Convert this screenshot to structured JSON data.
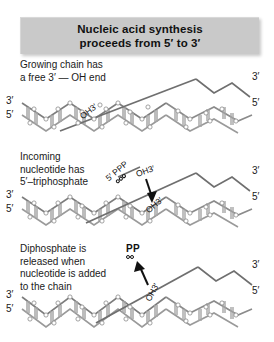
{
  "figure": {
    "width": 274,
    "height": 342,
    "background": "#ffffff"
  },
  "title": {
    "line1": "Nucleic acid synthesis",
    "line2": "proceeds from 5′ to 3′",
    "background_color": "#c9c9c9",
    "text_color": "#111111"
  },
  "panels": [
    {
      "id": "panel-growing-chain",
      "caption_lines": [
        "Growing chain has",
        "a free 3′ — OH end"
      ],
      "left_labels": {
        "top": "3′",
        "bottom": "5′"
      },
      "right_labels": {
        "top": "3′",
        "bottom": "5′"
      },
      "annotations": [
        {
          "name": "hydroxyl-label",
          "text": "OH3′"
        }
      ]
    },
    {
      "id": "panel-incoming-nucleotide",
      "caption_lines": [
        "Incoming",
        "nucleotide has",
        "5′–triphosphate"
      ],
      "left_labels": {
        "top": "3′",
        "bottom": "5′"
      },
      "right_labels": {
        "top": "3′",
        "bottom": "5′"
      },
      "annotations": [
        {
          "name": "triphosphate-label",
          "text": "5′ PPP",
          "phosphate_count": 3
        },
        {
          "name": "hydroxyl-label-upper",
          "text": "OH3′"
        },
        {
          "name": "hydroxyl-label-lower",
          "text": "OH3′"
        }
      ]
    },
    {
      "id": "panel-diphosphate-released",
      "caption_lines": [
        "Diphosphate is",
        "released when",
        "nucleotide is added",
        "to the chain"
      ],
      "left_labels": {
        "top": "3′",
        "bottom": "5′"
      },
      "right_labels": {
        "top": "3′",
        "bottom": "5′"
      },
      "annotations": [
        {
          "name": "pyrophosphate-label",
          "text": "PP",
          "phosphate_count": 2
        },
        {
          "name": "hydroxyl-label",
          "text": "OH3′"
        }
      ]
    }
  ]
}
